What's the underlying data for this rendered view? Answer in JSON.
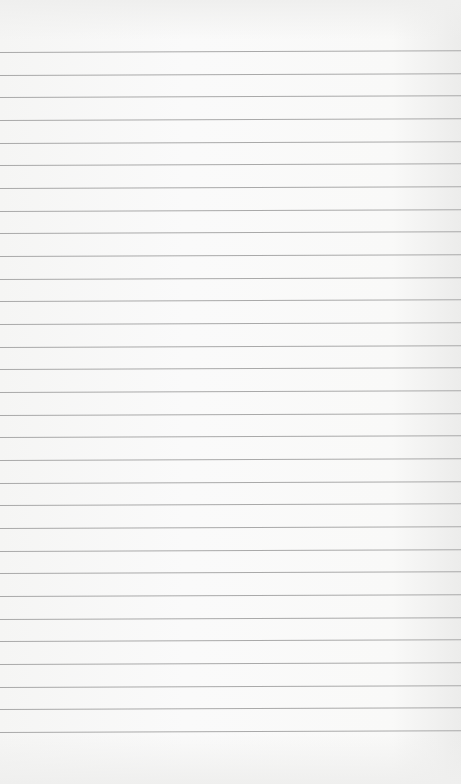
{
  "image": {
    "description": "Blank sheet of lined paper",
    "background_color": "#f7f7f6",
    "line_color": "#a9a9a9",
    "line_count": 31,
    "first_line_y": 52,
    "line_spacing_px": 22.67
  }
}
